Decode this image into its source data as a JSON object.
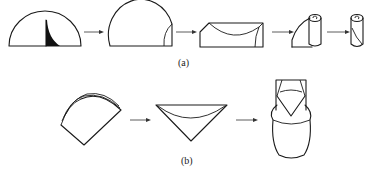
{
  "figure": {
    "panels": [
      {
        "id": "a",
        "label": "(a)",
        "steps": [
          "half-dome with shaded inner fold",
          "half-dome with folded right edge",
          "rectangle with curved top fold",
          "sheet partially rolled into tube",
          "rolled cylinder"
        ]
      },
      {
        "id": "b",
        "label": "(b)",
        "steps": [
          "fan-shaped sector with layered arcs",
          "inverted triangle cone with curved fold",
          "folded vessel shape"
        ]
      }
    ],
    "colors": {
      "stroke": "#1a1a1a",
      "fill_dark": "#111111",
      "background": "#ffffff",
      "arrow": "#333333"
    }
  }
}
